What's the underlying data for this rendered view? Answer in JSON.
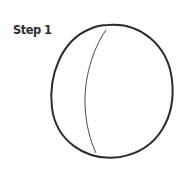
{
  "tutorial": {
    "step_label": "Step 1",
    "drawing": {
      "subject": "head-outline-with-center-guideline",
      "stroke_color": "#2b2b2b",
      "guide_color": "#4a4a4a"
    }
  }
}
